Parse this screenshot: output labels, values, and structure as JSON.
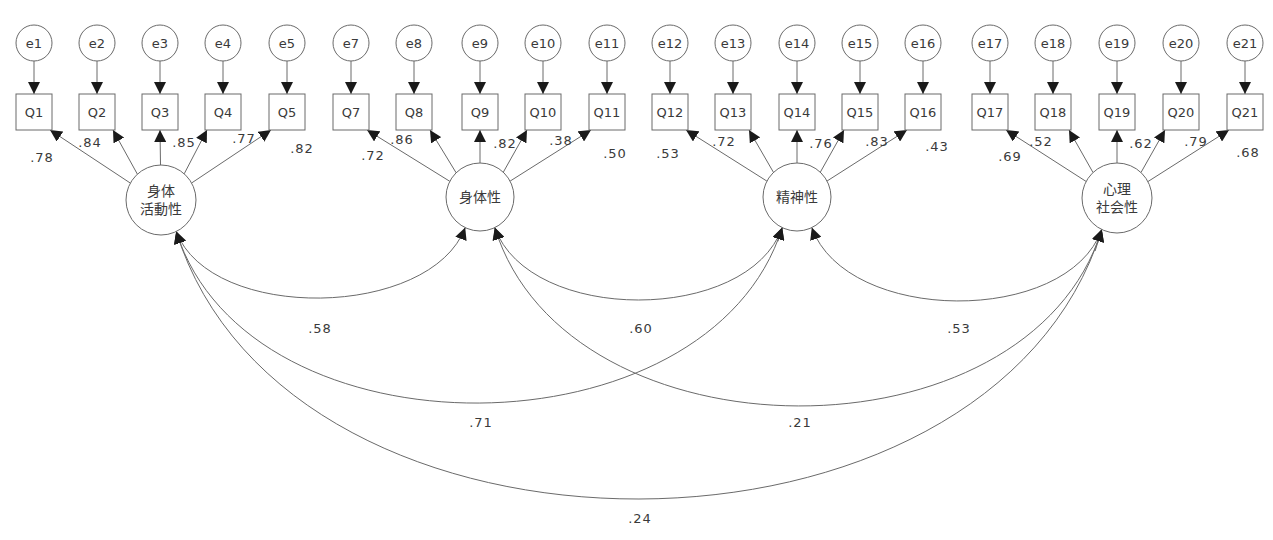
{
  "diagram": {
    "type": "confirmatory-factor-analysis-path-diagram",
    "latent_factors": [
      {
        "id": "F1",
        "label_lines": [
          "身体",
          "活動性"
        ],
        "cx": 161,
        "cy": 200,
        "r": 35
      },
      {
        "id": "F2",
        "label_lines": [
          "身体性"
        ],
        "cx": 480,
        "cy": 197,
        "r": 34
      },
      {
        "id": "F3",
        "label_lines": [
          "精神性"
        ],
        "cx": 797,
        "cy": 197,
        "r": 34
      },
      {
        "id": "F4",
        "label_lines": [
          "心理",
          "社会性"
        ],
        "cx": 1117,
        "cy": 198,
        "r": 35
      }
    ],
    "indicators": [
      {
        "error": "e1",
        "item": "Q1",
        "x": 34,
        "factor": "F1",
        "loading": ".78",
        "lx": 42,
        "ly": 162
      },
      {
        "error": "e2",
        "item": "Q2",
        "x": 97,
        "factor": "F1",
        "loading": ".84",
        "lx": 90,
        "ly": 147
      },
      {
        "error": "e3",
        "item": "Q3",
        "x": 160,
        "factor": "F1",
        "loading": ".85",
        "lx": 184,
        "ly": 147
      },
      {
        "error": "e4",
        "item": "Q4",
        "x": 223,
        "factor": "F1",
        "loading": ".77",
        "lx": 244,
        "ly": 143
      },
      {
        "error": "e5",
        "item": "Q5",
        "x": 287,
        "factor": "F1",
        "loading": ".82",
        "lx": 302,
        "ly": 153
      },
      {
        "error": "e7",
        "item": "Q7",
        "x": 351,
        "factor": "F2",
        "loading": ".72",
        "lx": 373,
        "ly": 160
      },
      {
        "error": "e8",
        "item": "Q8",
        "x": 414,
        "factor": "F2",
        "loading": ".86",
        "lx": 402,
        "ly": 144
      },
      {
        "error": "e9",
        "item": "Q9",
        "x": 480,
        "factor": "F2",
        "loading": ".82",
        "lx": 505,
        "ly": 148
      },
      {
        "error": "e10",
        "item": "Q10",
        "x": 543,
        "factor": "F2",
        "loading": ".38",
        "lx": 561,
        "ly": 145
      },
      {
        "error": "e11",
        "item": "Q11",
        "x": 607,
        "factor": "F2",
        "loading": ".50",
        "lx": 615,
        "ly": 158
      },
      {
        "error": "e12",
        "item": "Q12",
        "x": 670,
        "factor": "F3",
        "loading": ".53",
        "lx": 668,
        "ly": 158
      },
      {
        "error": "e13",
        "item": "Q13",
        "x": 733,
        "factor": "F3",
        "loading": ".72",
        "lx": 724,
        "ly": 146
      },
      {
        "error": "e14",
        "item": "Q14",
        "x": 797,
        "factor": "F3",
        "loading": ".76",
        "lx": 821,
        "ly": 148
      },
      {
        "error": "e15",
        "item": "Q15",
        "x": 860,
        "factor": "F3",
        "loading": ".83",
        "lx": 877,
        "ly": 146
      },
      {
        "error": "e16",
        "item": "Q16",
        "x": 923,
        "factor": "F3",
        "loading": ".43",
        "lx": 937,
        "ly": 151
      },
      {
        "error": "e17",
        "item": "Q17",
        "x": 990,
        "factor": "F4",
        "loading": ".69",
        "lx": 1010,
        "ly": 161
      },
      {
        "error": "e18",
        "item": "Q18",
        "x": 1053,
        "factor": "F4",
        "loading": ".52",
        "lx": 1041,
        "ly": 146
      },
      {
        "error": "e19",
        "item": "Q19",
        "x": 1117,
        "factor": "F4",
        "loading": ".62",
        "lx": 1141,
        "ly": 148
      },
      {
        "error": "e20",
        "item": "Q20",
        "x": 1181,
        "factor": "F4",
        "loading": ".79",
        "lx": 1196,
        "ly": 146
      },
      {
        "error": "e21",
        "item": "Q21",
        "x": 1245,
        "factor": "F4",
        "loading": ".68",
        "lx": 1248,
        "ly": 157
      }
    ],
    "covariances": [
      {
        "from": "F1",
        "to": "F2",
        "value": ".58",
        "lx": 320,
        "ly": 333
      },
      {
        "from": "F2",
        "to": "F3",
        "value": ".60",
        "lx": 641,
        "ly": 333
      },
      {
        "from": "F3",
        "to": "F4",
        "value": ".53",
        "lx": 959,
        "ly": 333
      },
      {
        "from": "F1",
        "to": "F3",
        "value": ".71",
        "lx": 481,
        "ly": 427
      },
      {
        "from": "F2",
        "to": "F4",
        "value": ".21",
        "lx": 800,
        "ly": 427
      },
      {
        "from": "F1",
        "to": "F4",
        "value": ".24",
        "lx": 640,
        "ly": 523
      }
    ],
    "colors": {
      "line": "#6a6a6a",
      "arrowhead": "#1a1a1a",
      "text": "#3a3a3a",
      "background": "#ffffff"
    }
  }
}
